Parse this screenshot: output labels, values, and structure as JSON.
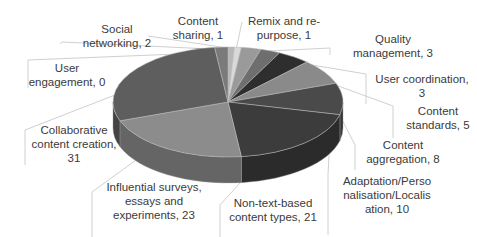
{
  "chart_data": {
    "type": "pie",
    "style": "3d-pie-grayscale",
    "title": "",
    "legend": "none",
    "total": 108,
    "slices": [
      {
        "label": "Content sharing",
        "value": 1,
        "color": "#b8b8b8"
      },
      {
        "label": "Remix and re-purpose",
        "value": 1,
        "color": "#d9d9d9"
      },
      {
        "label": "Quality management",
        "value": 3,
        "color": "#9a9a9a"
      },
      {
        "label": "User coordination",
        "value": 3,
        "color": "#6e6e6e"
      },
      {
        "label": "Content standards",
        "value": 5,
        "color": "#2e2e2e"
      },
      {
        "label": "Content aggregation",
        "value": 8,
        "color": "#8a8a8a"
      },
      {
        "label": "Adaptation/Personalisation/Localisation",
        "value": 10,
        "color": "#4a4a4a"
      },
      {
        "label": "Non-text-based content types",
        "value": 21,
        "color": "#3c3c3c"
      },
      {
        "label": "Influential surveys, essays and experiments",
        "value": 23,
        "color": "#8c8c8c"
      },
      {
        "label": "Collaborative content creation",
        "value": 31,
        "color": "#5e5e5e"
      },
      {
        "label": "User engagement",
        "value": 0,
        "color": "#555555"
      },
      {
        "label": "Social networking",
        "value": 2,
        "color": "#7a7a7a"
      }
    ]
  },
  "labels": [
    {
      "text": "Social\nnetworking, 2",
      "x": 72,
      "y": 22,
      "w": 90
    },
    {
      "text": "Content\nsharing, 1",
      "x": 163,
      "y": 14,
      "w": 70
    },
    {
      "text": "Remix and re-\npurpose, 1",
      "x": 244,
      "y": 14,
      "w": 80
    },
    {
      "text": "Quality\nmanagement, 3",
      "x": 348,
      "y": 32,
      "w": 90
    },
    {
      "text": "User\nengagement, 0",
      "x": 22,
      "y": 61,
      "w": 90
    },
    {
      "text": "User coordination,\n3",
      "x": 370,
      "y": 72,
      "w": 104
    },
    {
      "text": "Content\nstandards, 5",
      "x": 398,
      "y": 104,
      "w": 80
    },
    {
      "text": "Collaborative\ncontent creation,\n31",
      "x": 24,
      "y": 123,
      "w": 100
    },
    {
      "text": "Content\naggregation, 8",
      "x": 358,
      "y": 138,
      "w": 90
    },
    {
      "text": "Adaptation/Perso\nnalisation/Localis\nation, 10",
      "x": 332,
      "y": 174,
      "w": 110
    },
    {
      "text": "Influential surveys,\nessays and\nexperiments, 23",
      "x": 94,
      "y": 180,
      "w": 120
    },
    {
      "text": "Non-text-based\ncontent types, 21",
      "x": 218,
      "y": 196,
      "w": 110
    }
  ]
}
